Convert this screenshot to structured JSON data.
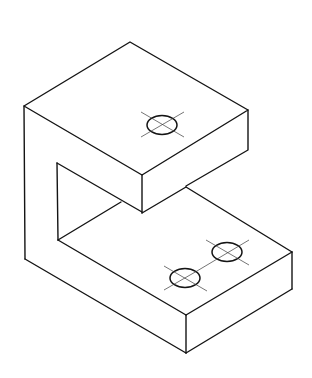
{
  "figure": {
    "colors": {
      "line": "#141414",
      "centerline": "#3a3a3a",
      "background": "#ffffff"
    },
    "holes": [
      {
        "name": "top-hole",
        "cx": 162,
        "cy": 125,
        "rx": 15,
        "ry": 9.5
      },
      {
        "name": "base-hole-rear",
        "cx": 227,
        "cy": 252,
        "rx": 15,
        "ry": 9.5
      },
      {
        "name": "base-hole-front",
        "cx": 185,
        "cy": 278,
        "rx": 15,
        "ry": 9.5
      }
    ]
  }
}
